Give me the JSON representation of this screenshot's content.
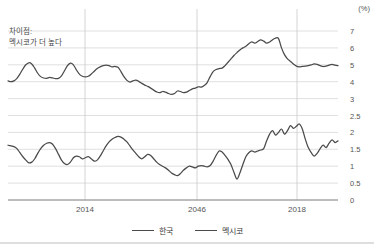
{
  "annotation": {
    "line1": "차이점:",
    "line2": "멕시코가 더 높다"
  },
  "axis": {
    "unit": "(%)",
    "y_ticks": [
      "7",
      "6",
      "5",
      "4",
      "3",
      "2.5",
      "2",
      "1.5",
      "1",
      "0.5",
      "0"
    ],
    "x_ticks": [
      "2014",
      "2046",
      "2018"
    ]
  },
  "legend": [
    {
      "label": "한국",
      "color": "#4a4a4a"
    },
    {
      "label": "멕시코",
      "color": "#4a4a4a"
    }
  ],
  "chart_data": {
    "type": "line",
    "title": "",
    "subtitle": "",
    "xlabel": "",
    "ylabel": "",
    "unit": "(%)",
    "grid": true,
    "legend_position": "bottom",
    "annotation": "차이점: 멕시코가 더 높다",
    "y_tick_labels": [
      "7",
      "6",
      "5",
      "4",
      "3",
      "2.5",
      "2",
      "1.5",
      "1",
      "0.5",
      "0"
    ],
    "y_axis_note": "Broken dual-band axis: upper band 3-7 (Mexico), lower band 0-2.5 (Korea)",
    "x_tick_labels": [
      "2014",
      "2046",
      "2018"
    ],
    "x_tick_positions": [
      85,
      197,
      297
    ],
    "series": [
      {
        "name": "멕시코",
        "color": "#4a4a4a",
        "band": "upper",
        "ylim": [
          3,
          7
        ],
        "values": [
          4.05,
          4.0,
          4.05,
          4.2,
          4.45,
          4.75,
          5.0,
          5.12,
          5.05,
          4.8,
          4.5,
          4.3,
          4.22,
          4.2,
          4.25,
          4.22,
          4.18,
          4.2,
          4.35,
          4.65,
          4.95,
          5.1,
          5.0,
          4.7,
          4.45,
          4.32,
          4.28,
          4.32,
          4.45,
          4.62,
          4.78,
          4.88,
          4.95,
          4.98,
          4.95,
          4.88,
          4.9,
          4.85,
          4.6,
          4.3,
          4.08,
          3.98,
          4.05,
          4.1,
          4.02,
          3.9,
          3.8,
          3.72,
          3.62,
          3.5,
          3.4,
          3.35,
          3.42,
          3.38,
          3.3,
          3.25,
          3.3,
          3.45,
          3.42,
          3.35,
          3.38,
          3.48,
          3.58,
          3.62,
          3.7,
          3.68,
          3.78,
          3.95,
          4.3,
          4.6,
          4.72,
          4.78,
          4.8,
          4.95,
          5.15,
          5.35,
          5.55,
          5.72,
          5.88,
          6.0,
          6.1,
          6.25,
          6.35,
          6.28,
          6.38,
          6.48,
          6.4,
          6.28,
          6.35,
          6.48,
          6.58,
          6.55,
          6.0,
          5.6,
          5.35,
          5.2,
          5.05,
          4.92,
          4.88,
          4.9,
          4.92,
          4.95,
          5.0,
          5.05,
          5.02,
          4.95,
          4.9,
          4.92,
          4.98,
          5.02,
          4.98,
          4.95
        ]
      },
      {
        "name": "한국",
        "color": "#4a4a4a",
        "band": "lower",
        "ylim": [
          0,
          2.5
        ],
        "values": [
          1.62,
          1.6,
          1.58,
          1.52,
          1.4,
          1.28,
          1.18,
          1.1,
          1.12,
          1.22,
          1.38,
          1.52,
          1.62,
          1.68,
          1.7,
          1.65,
          1.52,
          1.35,
          1.18,
          1.08,
          1.05,
          1.12,
          1.25,
          1.3,
          1.28,
          1.22,
          1.25,
          1.28,
          1.22,
          1.15,
          1.18,
          1.3,
          1.45,
          1.6,
          1.72,
          1.8,
          1.85,
          1.88,
          1.86,
          1.8,
          1.72,
          1.6,
          1.48,
          1.38,
          1.28,
          1.22,
          1.28,
          1.35,
          1.32,
          1.22,
          1.12,
          1.05,
          1.0,
          0.95,
          0.88,
          0.8,
          0.75,
          0.72,
          0.78,
          0.88,
          0.95,
          1.0,
          0.98,
          0.95,
          1.0,
          1.02,
          1.0,
          0.98,
          1.02,
          1.15,
          1.32,
          1.45,
          1.42,
          1.32,
          1.2,
          1.05,
          0.82,
          0.62,
          0.8,
          1.05,
          1.28,
          1.4,
          1.45,
          1.42,
          1.45,
          1.48,
          1.52,
          1.75,
          1.95,
          2.05,
          1.92,
          2.0,
          2.1,
          1.95,
          2.05,
          2.2,
          2.12,
          2.18,
          2.25,
          2.1,
          1.8,
          1.55,
          1.4,
          1.3,
          1.38,
          1.52,
          1.62,
          1.55,
          1.68,
          1.78,
          1.7,
          1.75
        ]
      }
    ]
  }
}
